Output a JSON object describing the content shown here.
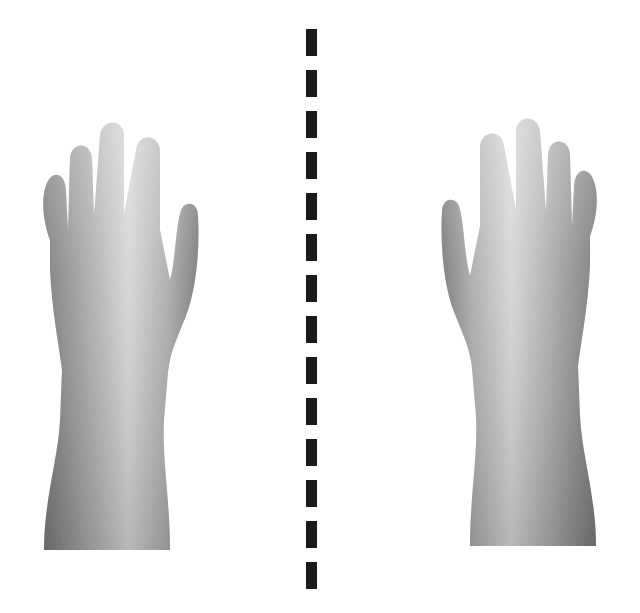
{
  "figure": {
    "background": "#ffffff",
    "symmetry_line": {
      "color": "#1a1a1a",
      "x": 306,
      "width": 11,
      "first_y": 29,
      "dash_length": 27,
      "period": 41,
      "count": 14
    },
    "hands": [
      {
        "id": "left-hand",
        "side": "left",
        "orientation": "back-of-right-hand-thumb-right",
        "x": 36,
        "y": 118,
        "mirrored": false
      },
      {
        "id": "right-hand",
        "side": "right",
        "orientation": "back-of-left-hand-thumb-left",
        "x": 434,
        "y": 114,
        "mirrored": true
      }
    ],
    "skin": {
      "light": "#d8d8d8",
      "mid": "#a9a9a9",
      "dark": "#6f6f6f"
    }
  }
}
